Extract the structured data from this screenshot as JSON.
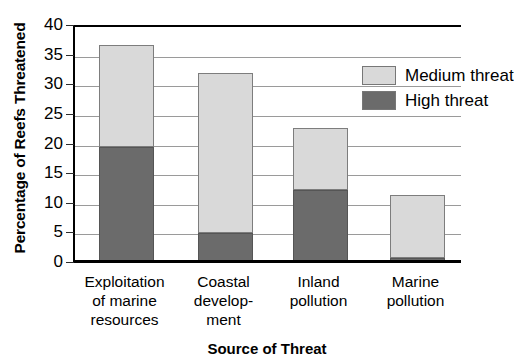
{
  "chart_data": {
    "type": "bar",
    "stacked": true,
    "title": "",
    "xlabel": "Source of Threat",
    "ylabel": "Percentage of Reefs Threatened",
    "categories": [
      "Exploitation\nof marine\nresources",
      "Coastal\ndevelop-\nment",
      "Inland\npollution",
      "Marine\npollution"
    ],
    "series": [
      {
        "name": "High threat",
        "color": "#6b6b6b",
        "values": [
          19.4,
          4.9,
          12.2,
          0.7
        ]
      },
      {
        "name": "Medium threat",
        "color": "#d9d9d9",
        "values": [
          17.3,
          27.0,
          10.4,
          10.6
        ]
      }
    ],
    "totals": [
      36.7,
      31.9,
      22.6,
      11.3
    ],
    "ylim": [
      0,
      40
    ],
    "yticks": [
      0,
      5,
      10,
      15,
      20,
      25,
      30,
      35,
      40
    ],
    "ytick_labels": [
      "0",
      "5",
      "10",
      "15",
      "20",
      "25",
      "30",
      "35",
      "40"
    ],
    "grid": true,
    "grid_axis": "y",
    "legend_position": "upper right",
    "legend_entries": [
      {
        "label": "Medium threat",
        "color": "#d9d9d9"
      },
      {
        "label": "High threat",
        "color": "#6b6b6b"
      }
    ]
  },
  "axes": {
    "y_title": "Percentage of Reefs Threatened",
    "x_title": "Source of Threat"
  },
  "colors": {
    "medium_threat": "#d9d9d9",
    "high_threat": "#6b6b6b",
    "gridline": "#9a9a9a",
    "axis": "#000000",
    "background": "#ffffff"
  }
}
